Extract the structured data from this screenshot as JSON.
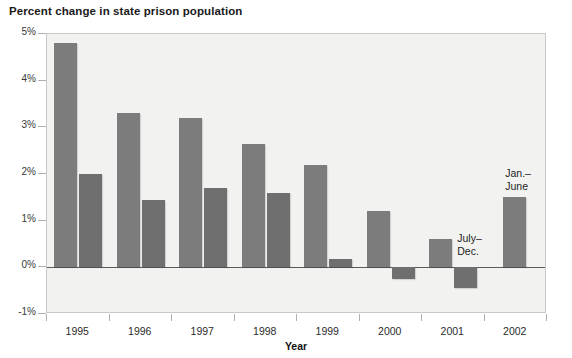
{
  "chart_data": {
    "type": "bar",
    "title": "Percent change in state prison population",
    "xlabel": "Year",
    "ylabel": "",
    "categories": [
      "1995",
      "1996",
      "1997",
      "1998",
      "1999",
      "2000",
      "2001",
      "2002"
    ],
    "series": [
      {
        "name": "Jan.-June",
        "values": [
          4.8,
          3.3,
          3.2,
          2.65,
          2.2,
          1.2,
          0.6,
          1.5
        ]
      },
      {
        "name": "July-Dec.",
        "values": [
          2.0,
          1.45,
          1.7,
          1.6,
          0.17,
          -0.25,
          -0.45,
          null
        ]
      }
    ],
    "ylim": [
      -1,
      5
    ],
    "yticks": [
      5,
      4,
      3,
      2,
      1,
      0,
      -1
    ],
    "ytick_labels": [
      "5%",
      "4%",
      "3%",
      "2%",
      "1%",
      "0%",
      "-1%"
    ],
    "grid": false,
    "legend": "none",
    "zero_line": true,
    "annotations": [
      {
        "text": "July-\nDec.",
        "label": "july-dec-annotation"
      },
      {
        "text": "Jan.-\nJune",
        "label": "jan-june-annotation"
      }
    ],
    "colors": {
      "bar": "#7c7c7c",
      "bar_dark": "#6f6f6f",
      "plot_background": "#f2f2f0",
      "axis": "#b0b0ac",
      "zero_line": "#5a5a5a",
      "text": "#1d1d1d"
    }
  },
  "annotations": {
    "july_dec": "July–\nDec.",
    "jan_june": "Jan.–\nJune"
  }
}
